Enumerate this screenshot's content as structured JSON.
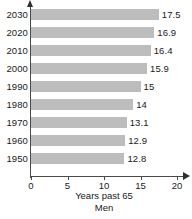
{
  "chart_data": {
    "type": "bar",
    "orientation": "horizontal",
    "title": "",
    "series_label": "Men",
    "xlabel": "Years past 65",
    "ylabel": "",
    "categories": [
      "2030",
      "2020",
      "2010",
      "2000",
      "1990",
      "1980",
      "1970",
      "1960",
      "1950"
    ],
    "values": [
      17.5,
      16.9,
      16.4,
      15.9,
      15,
      14,
      13.1,
      12.9,
      12.8
    ],
    "value_labels": [
      "17.5",
      "16.9",
      "16.4",
      "15.9",
      "15",
      "14",
      "13.1",
      "12.9",
      "12.8"
    ],
    "xlim": [
      0,
      20
    ],
    "xticks": [
      0,
      5,
      10,
      15,
      20
    ],
    "xtick_labels": [
      "0",
      "5",
      "10",
      "15",
      "20"
    ],
    "grid": false,
    "legend": "none",
    "bar_color": "#bdbdbd",
    "axis_color": "#4a4a4a",
    "text_color": "#1a1a1a"
  },
  "footer": {
    "cut_text": ""
  }
}
